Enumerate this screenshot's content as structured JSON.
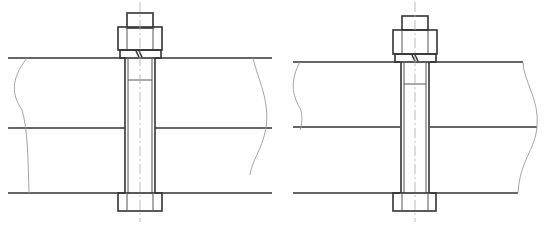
{
  "figure": {
    "type": "technical-drawing",
    "drawings": [
      {
        "id": "left",
        "description": "Bolt with nut through three plates, shank with gap (clearance hole)",
        "centerline_x": 140,
        "caption": ""
      },
      {
        "id": "right",
        "description": "Bolt with nut through three plates, reamed hole variant",
        "centerline_x": 415,
        "caption": ""
      }
    ],
    "colors": {
      "line": "#333333",
      "break_line": "#999999",
      "centerline": "#aaaaaa",
      "background": "#ffffff"
    }
  }
}
